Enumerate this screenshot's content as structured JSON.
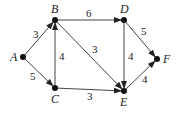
{
  "graph": {
    "nodes": [
      {
        "id": "A",
        "label": "A",
        "x": 23,
        "y": 57,
        "lx": 10,
        "ly": 61
      },
      {
        "id": "B",
        "label": "B",
        "x": 55,
        "y": 20,
        "lx": 51,
        "ly": 13
      },
      {
        "id": "C",
        "label": "C",
        "x": 55,
        "y": 88,
        "lx": 51,
        "ly": 103
      },
      {
        "id": "D",
        "label": "D",
        "x": 124,
        "y": 20,
        "lx": 120,
        "ly": 13
      },
      {
        "id": "E",
        "label": "E",
        "x": 124,
        "y": 91,
        "lx": 120,
        "ly": 106
      },
      {
        "id": "F",
        "label": "F",
        "x": 157,
        "y": 59,
        "lx": 163,
        "ly": 63
      }
    ],
    "edges": [
      {
        "from": "A",
        "to": "B",
        "weight": "3",
        "wx": 33,
        "wy": 38
      },
      {
        "from": "A",
        "to": "C",
        "weight": "5",
        "wx": 30,
        "wy": 80
      },
      {
        "from": "C",
        "to": "B",
        "weight": "4",
        "wx": 59,
        "wy": 60
      },
      {
        "from": "B",
        "to": "D",
        "weight": "6",
        "wx": 86,
        "wy": 17
      },
      {
        "from": "B",
        "to": "E",
        "weight": "3",
        "wx": 92,
        "wy": 53
      },
      {
        "from": "C",
        "to": "E",
        "weight": "3",
        "wx": 87,
        "wy": 100
      },
      {
        "from": "D",
        "to": "E",
        "weight": "4",
        "wx": 128,
        "wy": 60
      },
      {
        "from": "D",
        "to": "F",
        "weight": "5",
        "wx": 141,
        "wy": 35
      },
      {
        "from": "E",
        "to": "F",
        "weight": "4",
        "wx": 142,
        "wy": 83
      }
    ]
  }
}
